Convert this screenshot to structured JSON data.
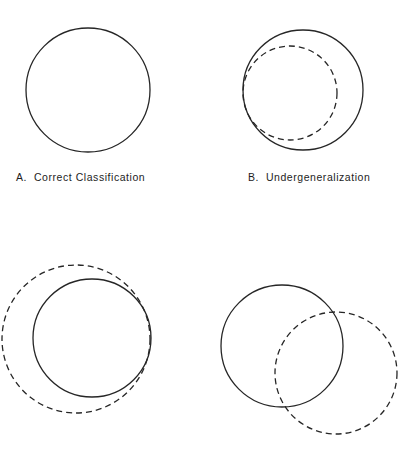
{
  "figure": {
    "background_color": "#ffffff",
    "stroke_color": "#262626",
    "width": 414,
    "height": 450
  },
  "chart_data": {
    "type": "diagram",
    "title": "",
    "subtitle": "",
    "legend": [
      {
        "name": "solid-circle",
        "style": "solid",
        "meaning": "target concept boundary"
      },
      {
        "name": "dashed-circle",
        "style": "dashed",
        "meaning": "learned concept boundary"
      }
    ],
    "grid": false,
    "xlabel": "",
    "ylabel": "",
    "panels": [
      {
        "id": "A",
        "label_letter": "A.",
        "label_text": "Correct Classification",
        "caption": "A.  Correct Classification",
        "has_caption": true,
        "relationship": "coincident",
        "circles": [
          {
            "name": "target-circle",
            "style": "solid",
            "cx": 88,
            "cy": 90,
            "r": 62
          }
        ]
      },
      {
        "id": "B",
        "label_letter": "B.",
        "label_text": "Undergeneralization",
        "caption": "B.  Undergeneralization",
        "has_caption": true,
        "relationship": "dashed-inside-solid, internally tangent at left",
        "circles": [
          {
            "name": "target-circle",
            "style": "solid",
            "cx": 303,
            "cy": 90,
            "r": 60
          },
          {
            "name": "learned-circle",
            "style": "dashed",
            "cx": 290,
            "cy": 93,
            "r": 47
          }
        ]
      },
      {
        "id": "C",
        "label_letter": "",
        "label_text": "",
        "caption": "",
        "has_caption": false,
        "relationship": "dashed-outside-solid, internally tangent at right",
        "circles": [
          {
            "name": "target-circle",
            "style": "solid",
            "cx": 92,
            "cy": 338,
            "r": 59
          },
          {
            "name": "learned-circle",
            "style": "dashed",
            "cx": 76,
            "cy": 339,
            "r": 74
          }
        ]
      },
      {
        "id": "D",
        "label_letter": "",
        "label_text": "",
        "caption": "",
        "has_caption": false,
        "relationship": "partially overlapping, dashed offset down-right",
        "circles": [
          {
            "name": "target-circle",
            "style": "solid",
            "cx": 282,
            "cy": 346,
            "r": 61
          },
          {
            "name": "learned-circle",
            "style": "dashed",
            "cx": 336,
            "cy": 373,
            "r": 61
          }
        ]
      }
    ],
    "stroke": {
      "color": "#262626",
      "width": 1.3,
      "dash_pattern": "6 4"
    }
  }
}
